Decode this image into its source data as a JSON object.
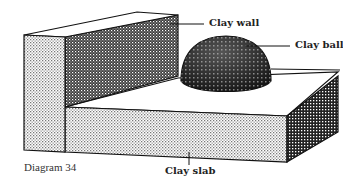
{
  "diagram": {
    "caption": "Diagram 34",
    "labels": {
      "wall": "Clay wall",
      "ball": "Clay ball",
      "slab": "Clay slab"
    },
    "colors": {
      "outline": "#111111",
      "light_stipple": "#bdbdbd",
      "dark_hatch": "#333333"
    }
  }
}
